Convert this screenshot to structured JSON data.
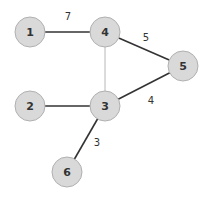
{
  "diagram": {
    "type": "weighted-undirected-graph",
    "colors": {
      "node_fill": "#d9d9d9",
      "node_stroke": "#b0b0b0",
      "edge_heavy": "#333333",
      "edge_light": "#b8b8b8",
      "text": "#333333"
    },
    "nodes": [
      {
        "id": "1",
        "label": "1",
        "x": 30,
        "y": 32
      },
      {
        "id": "4",
        "label": "4",
        "x": 105,
        "y": 32
      },
      {
        "id": "5",
        "label": "5",
        "x": 183,
        "y": 66
      },
      {
        "id": "2",
        "label": "2",
        "x": 30,
        "y": 106
      },
      {
        "id": "3",
        "label": "3",
        "x": 105,
        "y": 106
      },
      {
        "id": "6",
        "label": "6",
        "x": 67,
        "y": 172
      }
    ],
    "edges": [
      {
        "from": "1",
        "to": "4",
        "weight": "7",
        "style": "heavy",
        "label_x": 68,
        "label_y": 16
      },
      {
        "from": "4",
        "to": "5",
        "weight": "5",
        "style": "heavy",
        "label_x": 146,
        "label_y": 37
      },
      {
        "from": "4",
        "to": "3",
        "weight": "",
        "style": "light",
        "label_x": 0,
        "label_y": 0
      },
      {
        "from": "2",
        "to": "3",
        "weight": "",
        "style": "heavy",
        "label_x": 0,
        "label_y": 0
      },
      {
        "from": "3",
        "to": "5",
        "weight": "4",
        "style": "heavy",
        "label_x": 151,
        "label_y": 100
      },
      {
        "from": "3",
        "to": "6",
        "weight": "3",
        "style": "heavy",
        "label_x": 97,
        "label_y": 142
      }
    ]
  }
}
